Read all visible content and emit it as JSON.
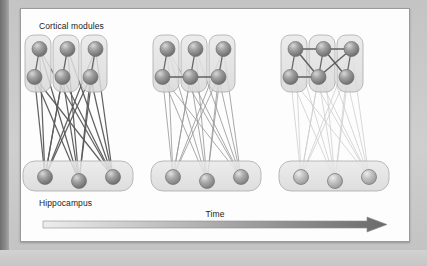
{
  "figure": {
    "labels": {
      "cortical_modules": "Cortical modules",
      "hippocampus": "Hippocampus",
      "time_axis": "Time"
    },
    "colors": {
      "canvas_background": "#fdfdfd",
      "frame_mat": "#c9c9c9",
      "node_fill": "#8f8f8f",
      "node_fill_light": "#b9b9b9",
      "node_stroke": "#6e6e6e",
      "module_box_fill": "#e0e0e0",
      "module_box_stroke": "#a9a9a9",
      "edge_strong": "#5a5a5a",
      "edge_medium": "#9a9a9a",
      "edge_weak": "#cfcfcf",
      "arrow_start": "#ededed",
      "arrow_end": "#6a6a6a",
      "label_text": "#1c1c1c"
    },
    "time_arrow": {
      "direction": "left-to-right",
      "gradient_from": "#ededed",
      "gradient_to": "#6a6a6a"
    },
    "panels": [
      {
        "id": "panel-early",
        "index": 1,
        "stage": "early",
        "x_offset": 0,
        "cortical_module_count": 3,
        "nodes_per_module": 2,
        "hippocampal_node_count": 3,
        "cortico_cortical_edge_strength": "none",
        "cortico_hippocampal_edge_strength": "strong",
        "hippocampal_node_shade": "dark",
        "cortico_cortical_edges": [],
        "intra_module_edges": [
          [
            0,
            1
          ],
          [
            2,
            3
          ],
          [
            4,
            5
          ]
        ]
      },
      {
        "id": "panel-intermediate",
        "index": 2,
        "stage": "intermediate",
        "x_offset": 128,
        "cortical_module_count": 3,
        "nodes_per_module": 2,
        "hippocampal_node_count": 3,
        "cortico_cortical_edge_strength": "partial",
        "cortico_hippocampal_edge_strength": "medium",
        "hippocampal_node_shade": "medium",
        "cortico_cortical_edges": [
          [
            1,
            3
          ],
          [
            3,
            5
          ]
        ],
        "intra_module_edges": [
          [
            0,
            1
          ],
          [
            2,
            3
          ],
          [
            4,
            5
          ]
        ]
      },
      {
        "id": "panel-late",
        "index": 3,
        "stage": "late",
        "x_offset": 256,
        "cortical_module_count": 3,
        "nodes_per_module": 2,
        "hippocampal_node_count": 3,
        "cortico_cortical_edge_strength": "strong",
        "cortico_hippocampal_edge_strength": "weak",
        "hippocampal_node_shade": "light",
        "cortico_cortical_edges": [
          [
            0,
            2
          ],
          [
            2,
            4
          ],
          [
            1,
            3
          ],
          [
            0,
            3
          ],
          [
            2,
            5
          ],
          [
            3,
            4
          ]
        ],
        "intra_module_edges": [
          [
            0,
            1
          ],
          [
            2,
            3
          ],
          [
            4,
            5
          ]
        ]
      }
    ],
    "geometry": {
      "module_box": {
        "width": 26,
        "height": 57,
        "radius": 9,
        "top": 26
      },
      "module_x_positions": [
        4,
        32,
        60
      ],
      "node_radius": 7.5,
      "cortical_top_node_dy": 14,
      "cortical_bottom_node_dy": 42,
      "hippocampus_box": {
        "x": 2,
        "y": 152,
        "width": 110,
        "height": 30,
        "radius": 12
      },
      "hippocampus_node_x": [
        22,
        56,
        90
      ],
      "hippocampus_node_y": [
        168,
        172,
        168
      ]
    }
  }
}
